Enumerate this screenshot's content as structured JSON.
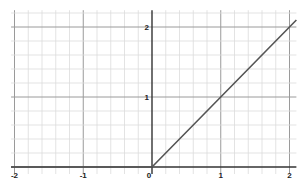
{
  "chart_data": {
    "type": "line",
    "title": "",
    "xlabel": "",
    "ylabel": "",
    "xlim": [
      -2.05,
      2.1
    ],
    "ylim": [
      -0.1,
      2.24
    ],
    "grid": true,
    "minor_grid_step": 0.2,
    "x_ticks": [
      -2,
      -1,
      0,
      1,
      2
    ],
    "x_tick_labels": [
      "-2",
      "-1",
      "0",
      "1",
      "2"
    ],
    "y_ticks": [
      1,
      2
    ],
    "y_tick_labels": [
      "1",
      "2"
    ],
    "series": [
      {
        "name": "f(x) = max(0, x)",
        "color": "#555555",
        "x": [
          -2.05,
          0,
          2.1
        ],
        "y": [
          0,
          0,
          2.1
        ]
      }
    ]
  }
}
